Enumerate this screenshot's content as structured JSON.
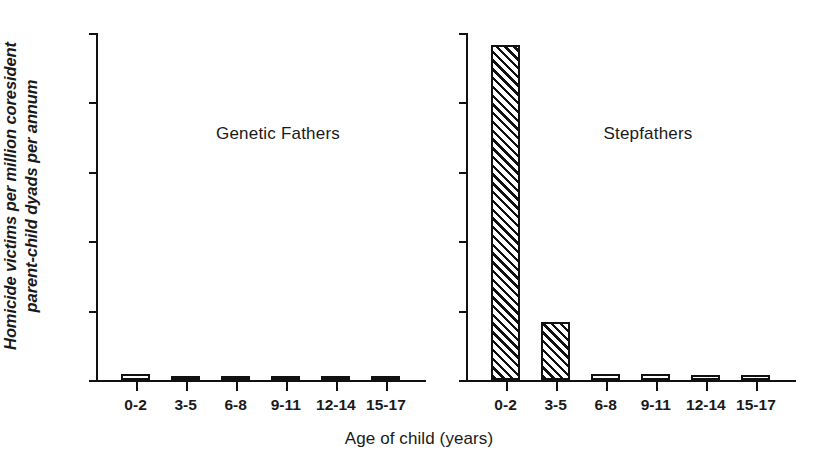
{
  "chart_data": {
    "type": "bar",
    "title": "",
    "xlabel": "Age of child (years)",
    "ylabel_line1": "Homicide victims per million coresident",
    "ylabel_line2": "parent-child dyads per annum",
    "categories": [
      "0-2",
      "3-5",
      "6-8",
      "9-11",
      "12-14",
      "15-17"
    ],
    "ylim": [
      0,
      600
    ],
    "y_tick_count": 6,
    "y_axis_labeled": false,
    "grid": false,
    "legend": "none",
    "panels": [
      {
        "name": "genetic-fathers",
        "title": "Genetic Fathers",
        "fill": "open",
        "values": [
          11,
          6,
          4,
          3,
          3,
          3
        ]
      },
      {
        "name": "stepfathers",
        "title": "Stepfathers",
        "fill": "hatched",
        "values": [
          580,
          100,
          11,
          11,
          9,
          8
        ]
      }
    ]
  },
  "panel_titles": {
    "left": "Genetic Fathers",
    "right": "Stepfathers"
  },
  "axis": {
    "x_title": "Age of child (years)",
    "y_title_line1": "Homicide victims per million coresident",
    "y_title_line2": "parent-child dyads per annum"
  },
  "colors": {
    "ink": "#111111",
    "background": "#ffffff"
  }
}
